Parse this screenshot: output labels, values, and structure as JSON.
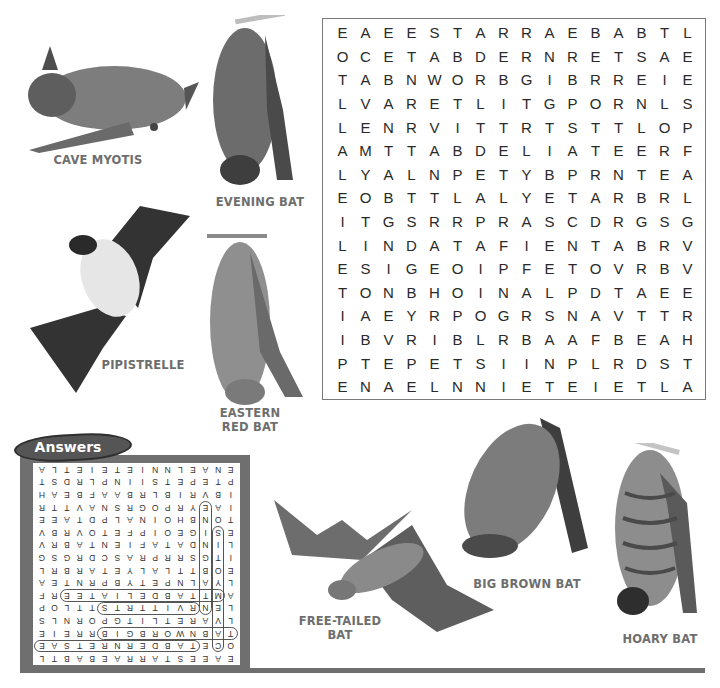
{
  "puzzle": {
    "rows": [
      "EAEESTARRAEBABTL",
      "OCETABDERNRETSAE",
      "TABNWORBGIBRREIE",
      "LVARETLITGPORNLS",
      "LENRVITTRTSTTLOP",
      "AMTTABDELIATEERF",
      "LYALNPETYBPRNTEA",
      "EOBTTLALYETARBRL",
      "ITGSRRPRASCDRGSG",
      "LINDATAFIENTABRV",
      "ESIGEOIPFETOVRBV",
      "TONBHOINALPDTAEE",
      "IAEYRPOGRSNAVTTR",
      "IBVRIBLRBAAFBEAH",
      "PTEPETSIINPLRDST",
      "ENAELNNIETEIETLA"
    ]
  },
  "bats": [
    {
      "name": "CAVE MYOTIS"
    },
    {
      "name": "EVENING BAT"
    },
    {
      "name": "PIPISTRELLE"
    },
    {
      "name": "EASTERN RED BAT",
      "line1": "EASTERN",
      "line2": "RED BAT"
    },
    {
      "name": "FREE-TAILED BAT",
      "line1": "FREE-TAILED",
      "line2": "BAT"
    },
    {
      "name": "BIG BROWN BAT"
    },
    {
      "name": "HOARY BAT"
    }
  ],
  "answers": {
    "title": "Answers",
    "words": [
      "EASTERN RED BAT",
      "BIG BROWN BAT",
      "FREE-TAILED BAT",
      "CAVE MYOTIS",
      "EVENING BAT",
      "PIPISTRELLE",
      "HOARY BAT"
    ]
  },
  "colors": {
    "frame": "#6f6f6f",
    "tab": "#555555",
    "label": "#6e6e6e"
  }
}
